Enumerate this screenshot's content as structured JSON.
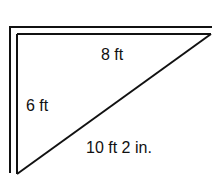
{
  "diagram": {
    "type": "right-triangle-measurement",
    "colors": {
      "line": "#111111",
      "background": "#ffffff"
    },
    "labels": {
      "top_side": "8 ft",
      "left_side": "6 ft",
      "hypotenuse": "10 ft 2 in."
    },
    "sides": [
      {
        "name": "top",
        "length": "8 ft"
      },
      {
        "name": "left",
        "length": "6 ft"
      },
      {
        "name": "hypotenuse",
        "length": "10 ft 2 in."
      }
    ]
  }
}
